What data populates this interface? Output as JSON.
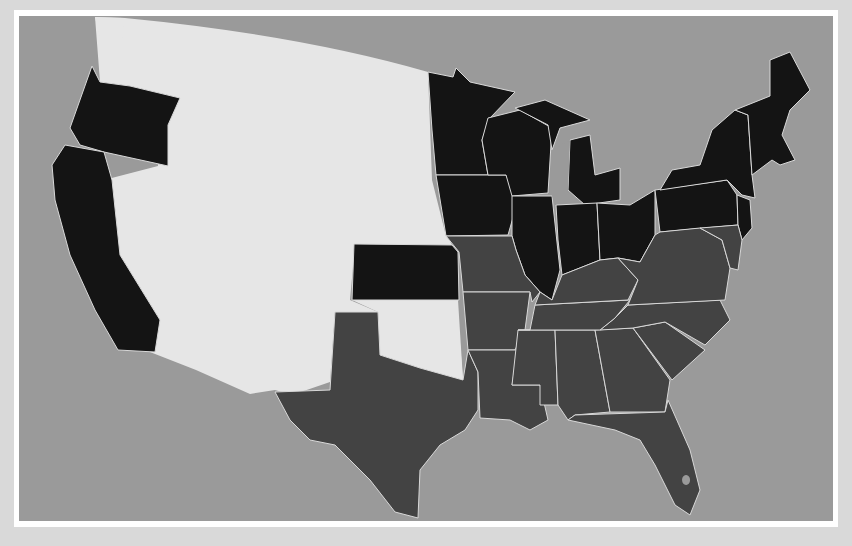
{
  "map": {
    "type": "choropleth",
    "subject": "United States",
    "colors": {
      "background": "#d9d9d9",
      "frame": "#ffffff",
      "water": "#9a9a9a",
      "territory": "#e6e6e6",
      "group_a": "#141414",
      "group_b": "#434343",
      "border": "#d8d8d8"
    },
    "groups": {
      "group_a": [
        "Washington-area (partial)",
        "Oregon",
        "California",
        "Kansas",
        "Minnesota",
        "Iowa",
        "Wisconsin",
        "Illinois",
        "Indiana",
        "Michigan",
        "Ohio",
        "Pennsylvania",
        "New York",
        "New Jersey",
        "Vermont",
        "New Hampshire",
        "Maine",
        "Massachusetts",
        "Connecticut",
        "Rhode Island"
      ],
      "group_b": [
        "Texas",
        "Missouri",
        "Arkansas",
        "Louisiana",
        "Mississippi",
        "Alabama",
        "Georgia",
        "Florida",
        "South Carolina",
        "North Carolina",
        "Tennessee",
        "Kentucky",
        "Virginia",
        "West Virginia",
        "Maryland",
        "Delaware"
      ],
      "territory": [
        "Western territories",
        "Indian Territory (Oklahoma)",
        "New Mexico Territory"
      ]
    }
  }
}
